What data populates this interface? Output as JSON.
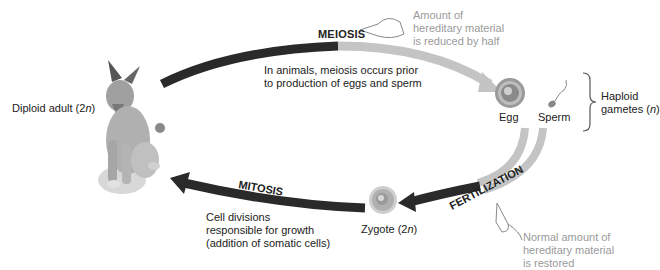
{
  "diagram": {
    "stages": {
      "adult": {
        "label_prefix": "Diploid adult (2",
        "label_italic": "n",
        "label_suffix": ")"
      },
      "egg": {
        "label": "Egg"
      },
      "sperm": {
        "label": "Sperm"
      },
      "gametes": {
        "label_line1": "Haploid",
        "label_line2_prefix": "gametes (",
        "label_line2_italic": "n",
        "label_line2_suffix": ")"
      },
      "zygote": {
        "label_prefix": "Zygote (2",
        "label_italic": "n",
        "label_suffix": ")"
      }
    },
    "processes": {
      "meiosis": {
        "title": "MEIOSIS",
        "description_line1": "In animals, meiosis occurs prior",
        "description_line2": "to production of eggs and sperm",
        "note_line1": "Amount of",
        "note_line2": "hereditary material",
        "note_line3": "is reduced by half"
      },
      "fertilization": {
        "title": "FERTILIZATION",
        "note_line1": "Normal amount of",
        "note_line2": "hereditary material",
        "note_line3": "is restored"
      },
      "mitosis": {
        "title": "MITOSIS",
        "description_line1": "Cell divisions",
        "description_line2": "responsible for growth",
        "description_line3": "(addition of somatic cells)"
      }
    },
    "colors": {
      "dark_arrow": "#2a2a2a",
      "light_arrow": "#c4c4c4",
      "note_text": "#9a9a9a"
    }
  }
}
